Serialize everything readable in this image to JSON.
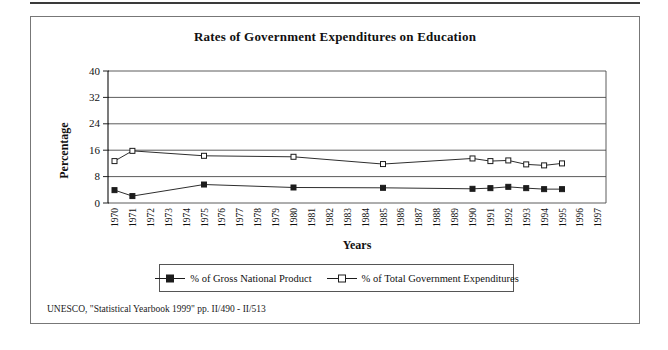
{
  "page": {
    "source": "UNESCO, \"Statistical Yearbook 1999\" pp. II/490 - II/513"
  },
  "chart_data": {
    "type": "line",
    "title": "Rates of Government Expenditures on Education",
    "xlabel": "Years",
    "ylabel": "Percentage",
    "ylim": [
      0,
      40
    ],
    "yticks": [
      0,
      8,
      16,
      24,
      32,
      40
    ],
    "grid": "horizontal",
    "legend_position": "bottom",
    "categories": [
      "1970",
      "1971",
      "1972",
      "1973",
      "1974",
      "1975",
      "1976",
      "1977",
      "1978",
      "1979",
      "1980",
      "1981",
      "1982",
      "1983",
      "1984",
      "1985",
      "1986",
      "1987",
      "1988",
      "1989",
      "1990",
      "1991",
      "1992",
      "1993",
      "1994",
      "1995",
      "1996",
      "1997"
    ],
    "series": [
      {
        "name": "% of Gross National Product",
        "marker": "filled-square",
        "points": [
          {
            "x": 1970,
            "y": 3.9
          },
          {
            "x": 1971,
            "y": 2.1
          },
          {
            "x": 1975,
            "y": 5.6
          },
          {
            "x": 1980,
            "y": 4.7
          },
          {
            "x": 1985,
            "y": 4.6
          },
          {
            "x": 1990,
            "y": 4.3
          },
          {
            "x": 1991,
            "y": 4.5
          },
          {
            "x": 1992,
            "y": 4.9
          },
          {
            "x": 1993,
            "y": 4.5
          },
          {
            "x": 1994,
            "y": 4.2
          },
          {
            "x": 1995,
            "y": 4.2
          }
        ]
      },
      {
        "name": "% of Total Government Expenditures",
        "marker": "open-square",
        "points": [
          {
            "x": 1970,
            "y": 12.7
          },
          {
            "x": 1971,
            "y": 15.8
          },
          {
            "x": 1975,
            "y": 14.3
          },
          {
            "x": 1980,
            "y": 14.0
          },
          {
            "x": 1985,
            "y": 11.8
          },
          {
            "x": 1990,
            "y": 13.5
          },
          {
            "x": 1991,
            "y": 12.7
          },
          {
            "x": 1992,
            "y": 12.9
          },
          {
            "x": 1993,
            "y": 11.7
          },
          {
            "x": 1994,
            "y": 11.4
          },
          {
            "x": 1995,
            "y": 12.0
          }
        ]
      }
    ],
    "colors": {
      "grid": "#4a4a4a",
      "axis": "#222222",
      "line": "#2e2e2e",
      "marker": "#1c1c1c",
      "marker_open_fill": "#ffffff",
      "text": "#111111"
    }
  }
}
